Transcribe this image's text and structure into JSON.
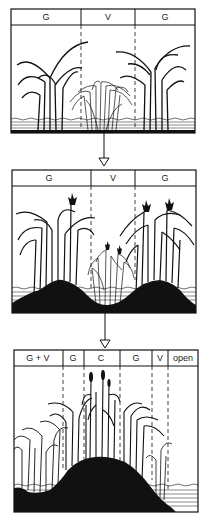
{
  "diagram": {
    "stages": [
      {
        "id": "stage-1",
        "zones": [
          {
            "label": "G"
          },
          {
            "label": "V"
          },
          {
            "label": "G"
          }
        ]
      },
      {
        "id": "stage-2",
        "zones": [
          {
            "label": "G"
          },
          {
            "label": "V"
          },
          {
            "label": "G"
          }
        ]
      },
      {
        "id": "stage-3",
        "zones": [
          {
            "label": "G + V"
          },
          {
            "label": "G"
          },
          {
            "label": "C"
          },
          {
            "label": "G"
          },
          {
            "label": "V"
          },
          {
            "label": "open"
          }
        ]
      }
    ],
    "arrows": [
      {
        "from": "stage-1",
        "to": "stage-2"
      },
      {
        "from": "stage-2",
        "to": "stage-3"
      }
    ],
    "colors": {
      "ink": "#111111",
      "background": "#ffffff"
    }
  }
}
